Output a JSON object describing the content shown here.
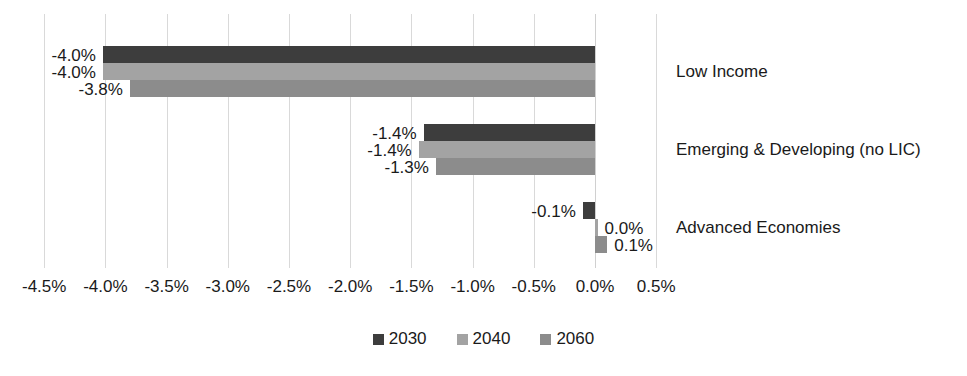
{
  "chart_data": {
    "type": "bar",
    "orientation": "horizontal",
    "title": "",
    "xlabel": "",
    "ylabel": "",
    "xlim": [
      -4.75,
      0.75
    ],
    "grid": true,
    "legend_position": "bottom-center",
    "categories": [
      "Low Income",
      "Emerging & Developing (no LIC)",
      "Advanced Economies"
    ],
    "tick_labels": [
      "-4.5%",
      "-4.0%",
      "-3.5%",
      "-3.0%",
      "-2.5%",
      "-2.0%",
      "-1.5%",
      "-1.0%",
      "-0.5%",
      "0.0%",
      "0.5%"
    ],
    "tick_values": [
      -4.5,
      -4.0,
      -3.5,
      -3.0,
      -2.5,
      -2.0,
      -1.5,
      -1.0,
      -0.5,
      0.0,
      0.5
    ],
    "series": [
      {
        "name": "2030",
        "color": "#3d3d3d",
        "values": [
          -4.02,
          -1.4,
          -0.1
        ],
        "labels": [
          "-4.0%",
          "-1.4%",
          "-0.1%"
        ]
      },
      {
        "name": "2040",
        "color": "#a3a3a3",
        "values": [
          -4.02,
          -1.44,
          0.0
        ],
        "labels": [
          "-4.0%",
          "-1.4%",
          "0.0%"
        ]
      },
      {
        "name": "2060",
        "color": "#8c8c8c",
        "values": [
          -3.8,
          -1.3,
          0.1
        ],
        "labels": [
          "-3.8%",
          "-1.3%",
          "0.1%"
        ]
      }
    ]
  },
  "legend": {
    "items": [
      {
        "label": "2030",
        "color": "#3d3d3d"
      },
      {
        "label": "2040",
        "color": "#a3a3a3"
      },
      {
        "label": "2060",
        "color": "#8c8c8c"
      }
    ]
  }
}
